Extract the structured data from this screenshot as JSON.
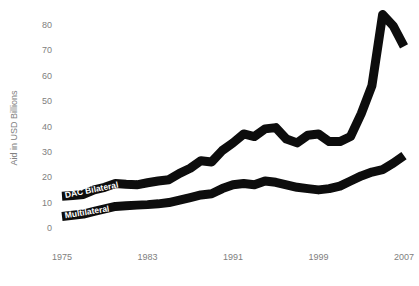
{
  "chart_data": {
    "type": "line",
    "title": "",
    "xlabel": "",
    "ylabel": "Aid in USD Billions",
    "xlim": [
      1975,
      2007
    ],
    "ylim": [
      0,
      85
    ],
    "grid": false,
    "legend_position": "inline-on-line-start",
    "x_ticks": [
      "1975",
      "1983",
      "1991",
      "1999",
      "2007"
    ],
    "x_tick_values": [
      1975,
      1983,
      1991,
      1999,
      2007
    ],
    "y_ticks": [
      "0",
      "10",
      "20",
      "30",
      "40",
      "50",
      "60",
      "70",
      "80"
    ],
    "y_tick_values": [
      0,
      10,
      20,
      30,
      40,
      50,
      60,
      70,
      80
    ],
    "x": [
      1975,
      1976,
      1977,
      1978,
      1979,
      1980,
      1981,
      1982,
      1983,
      1984,
      1985,
      1986,
      1987,
      1988,
      1989,
      1990,
      1991,
      1992,
      1993,
      1994,
      1995,
      1996,
      1997,
      1998,
      1999,
      2000,
      2001,
      2002,
      2003,
      2004,
      2005,
      2006,
      2007
    ],
    "series": [
      {
        "name": "DAC Bilateral",
        "color": "#0d0d0d",
        "values": [
          12.5,
          12.8,
          13.2,
          15.0,
          16.0,
          17.5,
          17.2,
          17.0,
          17.8,
          18.5,
          19.0,
          21.5,
          23.5,
          26.5,
          26.0,
          30.5,
          33.5,
          37.0,
          36.0,
          39.0,
          39.5,
          35.0,
          33.5,
          36.5,
          37.0,
          34.0,
          34.0,
          36.0,
          45.0,
          56.0,
          84.0,
          79.5,
          71.5
        ]
      },
      {
        "name": "Multilateral",
        "color": "#0d0d0d",
        "values": [
          4.5,
          5.0,
          5.5,
          6.5,
          7.5,
          8.5,
          8.8,
          9.0,
          9.2,
          9.5,
          10.0,
          11.0,
          12.0,
          13.0,
          13.5,
          15.5,
          17.0,
          17.5,
          17.0,
          18.5,
          18.0,
          17.0,
          16.0,
          15.5,
          15.0,
          15.5,
          16.5,
          18.5,
          20.5,
          22.0,
          23.0,
          25.5,
          28.5
        ]
      }
    ]
  },
  "axis": {
    "y_title": "Aid in USD Billions"
  }
}
